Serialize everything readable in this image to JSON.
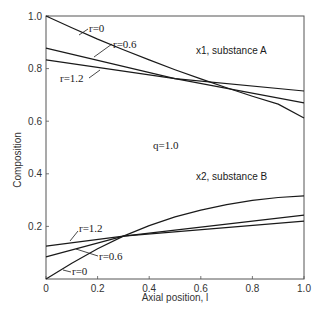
{
  "chart_data": {
    "type": "line",
    "title": "",
    "xlabel": "Axial position, l",
    "ylabel": "Composition",
    "xlim": [
      0,
      1.0
    ],
    "ylim": [
      0,
      1.0
    ],
    "grid": false,
    "x_ticks": [
      "0",
      "0.2",
      "0.4",
      "0.6",
      "0.8",
      "1.0"
    ],
    "y_ticks": [
      "0.2",
      "0.4",
      "0.6",
      "0.8",
      "1.0"
    ],
    "annotations": {
      "top_group": "x1, substance A",
      "bottom_group": "x2, substance B",
      "parameter": "q=1.0"
    },
    "series": [
      {
        "name": "x1, r=0",
        "x": [
          0,
          0.1,
          0.2,
          0.3,
          0.4,
          0.5,
          0.6,
          0.7,
          0.8,
          0.9,
          1.0
        ],
        "y": [
          1.0,
          0.955,
          0.912,
          0.872,
          0.833,
          0.796,
          0.761,
          0.727,
          0.695,
          0.665,
          0.612
        ]
      },
      {
        "name": "x1, r=0.6",
        "x": [
          0,
          0.5,
          1.0
        ],
        "y": [
          0.878,
          0.762,
          0.67
        ]
      },
      {
        "name": "x1, r=1.2",
        "x": [
          0,
          0.5,
          1.0
        ],
        "y": [
          0.833,
          0.762,
          0.715
        ]
      },
      {
        "name": "x2, r=0",
        "x": [
          0,
          0.1,
          0.2,
          0.3,
          0.4,
          0.5,
          0.6,
          0.7,
          0.8,
          0.9,
          1.0
        ],
        "y": [
          0.0,
          0.06,
          0.115,
          0.163,
          0.203,
          0.236,
          0.262,
          0.283,
          0.299,
          0.31,
          0.316
        ]
      },
      {
        "name": "x2, r=0.6",
        "x": [
          0,
          0.3,
          1.0
        ],
        "y": [
          0.084,
          0.163,
          0.243
        ]
      },
      {
        "name": "x2, r=1.2",
        "x": [
          0,
          0.3,
          1.0
        ],
        "y": [
          0.125,
          0.163,
          0.22
        ]
      }
    ],
    "labels": [
      {
        "text": "r=0",
        "group": "x1"
      },
      {
        "text": "r=0.6",
        "group": "x1"
      },
      {
        "text": "r=1.2",
        "group": "x1"
      },
      {
        "text": "r=1.2",
        "group": "x2"
      },
      {
        "text": "r=0.6",
        "group": "x2"
      },
      {
        "text": "r=0",
        "group": "x2"
      }
    ]
  }
}
